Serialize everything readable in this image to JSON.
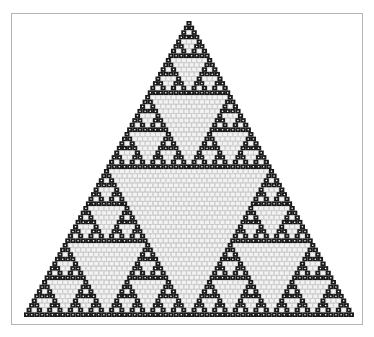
{
  "figure": {
    "type": "sierpinski-triangle",
    "rows": 64,
    "modulus": 2,
    "apex": [
      189,
      21
    ],
    "base_left": [
      24,
      317
    ],
    "base_right": [
      354,
      317
    ],
    "colors": {
      "odd_cell": "#1a1a1a",
      "odd_cell_dot": "#ffffff",
      "even_cell": "#f2f2f2",
      "even_cell_line": "#b8b8b8",
      "frame": "#b4b4b4",
      "background": "#ffffff"
    }
  }
}
